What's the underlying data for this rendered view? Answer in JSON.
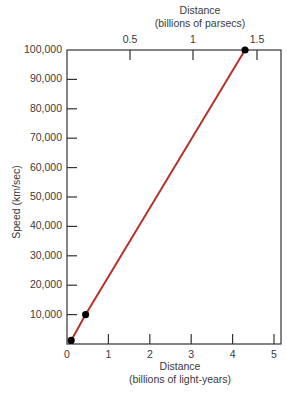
{
  "chart_data": {
    "type": "line",
    "title": "",
    "xlabel": "Distance (billions of light-years)",
    "xlabel_line1": "Distance",
    "xlabel_line2": "(billions of light-years)",
    "x2label_line1": "Distance",
    "x2label_line2": "(billions of parsecs)",
    "ylabel": "Speed (km/sec)",
    "xlim": [
      0,
      5.15
    ],
    "ylim": [
      0,
      100000
    ],
    "x_ticks": [
      "0",
      "1",
      "2",
      "3",
      "4",
      "5"
    ],
    "x2_ticks": [
      "0.5",
      "1",
      "1.5"
    ],
    "y_ticks": [
      "10,000",
      "20,000",
      "30,000",
      "40,000",
      "50,000",
      "60,000",
      "70,000",
      "80,000",
      "90,000",
      "100,000"
    ],
    "grid": false,
    "series": [
      {
        "name": "Hubble relation",
        "color": "#b5332a",
        "x": [
          0.1,
          0.45,
          4.3
        ],
        "y": [
          1200,
          10000,
          100000
        ],
        "points": [
          {
            "x": 0.1,
            "y": 1200
          },
          {
            "x": 0.45,
            "y": 10000
          },
          {
            "x": 4.3,
            "y": 100000
          }
        ]
      }
    ]
  }
}
